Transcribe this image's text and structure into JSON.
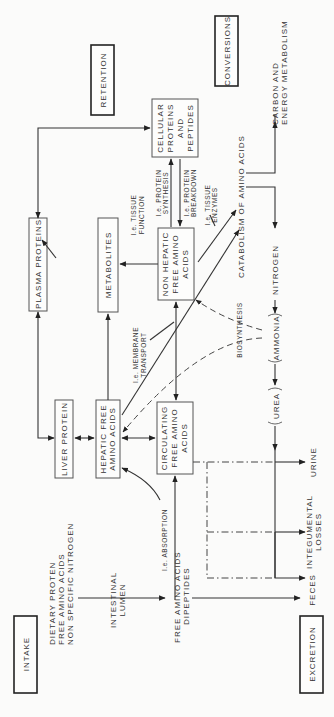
{
  "sections": {
    "intake": "INTAKE",
    "retention": "RETENTION",
    "conversions": "CONVERSIONS",
    "excretion": "EXCRETION"
  },
  "intake_sources": {
    "line1": "DIETARY PROTEN",
    "line2": "FREE AMINO ACIDS",
    "line3": "NON SPECIFIC NITROGEN"
  },
  "intestinal_lumen": {
    "line1": "INTESTINAL",
    "line2": "LUMEN"
  },
  "absorbed": {
    "line1": "FREE AMINO ACIDS",
    "line2": "DIPEPTIDES"
  },
  "nodes": {
    "plasma_proteins": "PLASMA PROTEINS",
    "liver_protein": "LIVER PROTEIN",
    "hepatic_free": {
      "line1": "HEPATIC FREE",
      "line2": "AMINO ACIDS"
    },
    "circulating_free": {
      "line1": "CIRCULATING",
      "line2": "FREE AMINO",
      "line3": "ACIDS"
    },
    "metabolites": "METABOLITES",
    "non_hepatic_free": {
      "line1": "NON HEPATIC",
      "line2": "FREE AMINO",
      "line3": "ACIDS"
    },
    "cellular_proteins": {
      "line1": "CELLULAR",
      "line2": "PROTEINS",
      "line3": "AND",
      "line4": "PEPTIDES"
    }
  },
  "annotations": {
    "absorption": "I.e. ABSORPTION",
    "membrane_transport": {
      "line1": "I.e. MEMBRANE",
      "line2": "TRANSPORT"
    },
    "tissue_function": {
      "line1": "I.e. TISSUE",
      "line2": "FUNCTION"
    },
    "protein_synthesis": {
      "line1": "I.e. PROTEIN",
      "line2": "SYNTHESIS"
    },
    "protein_breakdown": {
      "line1": "I.e. PROTEIN",
      "line2": "BREAKDOWN"
    },
    "tissue_enzymes": {
      "line1": "I.e. TISSUE",
      "line2": "ENZYMES"
    },
    "biosynthesis": "BIOSYNTHESIS"
  },
  "conversions_flow": {
    "catabolism": "CATABOLISM OF AMINO ACIDS",
    "carbon_energy": {
      "line1": "CARBON AND",
      "line2": "ENERGY METABOLISM"
    },
    "nitrogen": "NITROGEN",
    "ammonia": "AMMONIA",
    "urea": "UREA"
  },
  "excretion_outputs": {
    "urine": "URINE",
    "integumental": {
      "line1": "INTEGUMENTAL",
      "line2": "LOSSES"
    },
    "feces": "FECES"
  }
}
